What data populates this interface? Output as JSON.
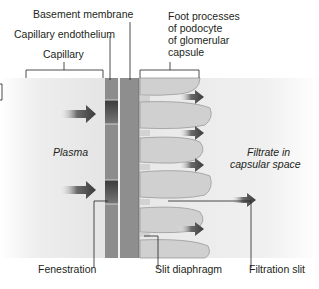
{
  "labels": {
    "basement_membrane": "Basement membrane",
    "capillary_endothelium": "Capillary endothelium",
    "capillary": "Capillary",
    "foot_processes": [
      "Foot processes",
      "of podocyte",
      "of glomerular",
      "capsule"
    ],
    "plasma": "Plasma",
    "filtrate": [
      "Filtrate in",
      "capsular space"
    ],
    "fenestration": "Fenestration",
    "slit_diaphragm": "Slit diaphragm",
    "filtration_slit": "Filtration slit"
  },
  "colors": {
    "endothelium": "#8a8a8a",
    "fenestration_dark": "#4a4a4a",
    "basement": "#8e8e8e",
    "foot_process": "#cfcfcf",
    "arrow": "#4a4a4a",
    "background_gradient": "#e6e6e6"
  }
}
